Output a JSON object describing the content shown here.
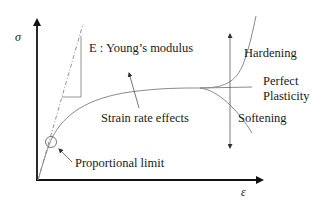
{
  "diagram": {
    "type": "stress-strain curve",
    "axes": {
      "y_label": "σ",
      "x_label": "ε"
    },
    "labels": {
      "youngs_modulus": "E : Young’s modulus",
      "hardening": "Hardening",
      "perfect": "Perfect",
      "plasticity": "Plasticity",
      "softening": "Softening",
      "strain_rate": "Strain rate effects",
      "proportional_limit": "Proportional limit"
    },
    "branches": [
      "Hardening",
      "Perfect Plasticity",
      "Softening"
    ],
    "colors": {
      "axis": "#111111",
      "curve": "#8a8a8a",
      "text": "#1a1a1a"
    }
  }
}
